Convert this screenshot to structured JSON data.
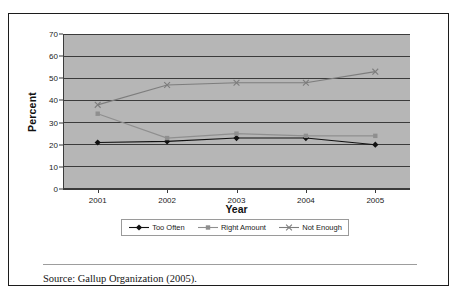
{
  "figure": {
    "source_note": "Source: Gallup Organization (2005)."
  },
  "chart_data": {
    "type": "line",
    "title": "",
    "xlabel": "Year",
    "ylabel": "Percent",
    "categories": [
      "2001",
      "2002",
      "2003",
      "2004",
      "2005"
    ],
    "x": [
      2001,
      2002,
      2003,
      2004,
      2005
    ],
    "ylim": [
      0,
      70
    ],
    "ytick_labels": [
      "0",
      "10",
      "20",
      "30",
      "40",
      "50",
      "60",
      "70"
    ],
    "yticks": [
      0,
      10,
      20,
      30,
      40,
      50,
      60,
      70
    ],
    "grid": true,
    "legend_position": "bottom",
    "plot_background": "#b6b6b6",
    "series": [
      {
        "name": "Too Often",
        "values": [
          21,
          21.5,
          23,
          23,
          20
        ],
        "color": "#111111",
        "marker": "diamond"
      },
      {
        "name": "Right Amount",
        "values": [
          34,
          23,
          25,
          24,
          24
        ],
        "color": "#8f8f8f",
        "marker": "square"
      },
      {
        "name": "Not Enough",
        "values": [
          38,
          47,
          48,
          48,
          53
        ],
        "color": "#7d7d7d",
        "marker": "x"
      }
    ]
  }
}
